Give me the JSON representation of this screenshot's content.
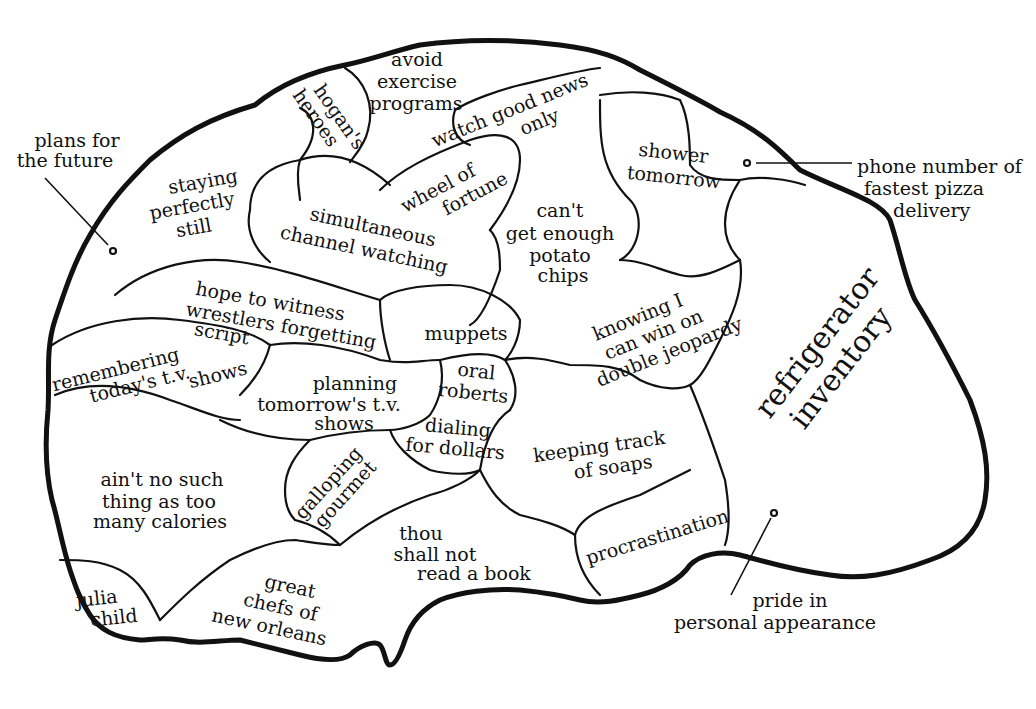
{
  "diagram": {
    "type": "brain-map",
    "outline_color": "#111111",
    "background": "#ffffff",
    "regions": [
      {
        "id": "hogans-heroes",
        "lines": [
          "hogan's",
          "heroes"
        ]
      },
      {
        "id": "avoid-exercise",
        "lines": [
          "avoid",
          "exercise",
          "programs"
        ]
      },
      {
        "id": "watch-good-news",
        "lines": [
          "watch good news",
          "only"
        ]
      },
      {
        "id": "shower-tomorrow",
        "lines": [
          "shower",
          "tomorrow"
        ]
      },
      {
        "id": "staying-still",
        "lines": [
          "staying",
          "perfectly",
          "still"
        ]
      },
      {
        "id": "wheel-of-fortune",
        "lines": [
          "wheel of",
          "fortune"
        ]
      },
      {
        "id": "simultaneous-channel",
        "lines": [
          "simultaneous",
          "channel watching"
        ]
      },
      {
        "id": "potato-chips",
        "lines": [
          "can't",
          "get enough",
          "potato",
          "chips"
        ]
      },
      {
        "id": "wrestlers",
        "lines": [
          "hope to witness",
          "wrestlers forgetting",
          "script"
        ]
      },
      {
        "id": "muppets",
        "lines": [
          "muppets"
        ]
      },
      {
        "id": "double-jeopardy",
        "lines": [
          "knowing I",
          "can win on",
          "double jeopardy"
        ]
      },
      {
        "id": "refrigerator",
        "lines": [
          "refrigerator",
          "inventory"
        ]
      },
      {
        "id": "remembering-tv",
        "lines": [
          "remembering",
          "today's t.v.",
          "shows"
        ]
      },
      {
        "id": "planning-tv",
        "lines": [
          "planning",
          "tomorrow's t.v.",
          "shows"
        ]
      },
      {
        "id": "oral-roberts",
        "lines": [
          "oral",
          "roberts"
        ]
      },
      {
        "id": "dialing-dollars",
        "lines": [
          "dialing",
          "for dollars"
        ]
      },
      {
        "id": "keeping-soaps",
        "lines": [
          "keeping track",
          "of soaps"
        ]
      },
      {
        "id": "calories",
        "lines": [
          "ain't no such",
          "thing as too",
          "many calories"
        ]
      },
      {
        "id": "galloping-gourmet",
        "lines": [
          "galloping",
          "gourmet"
        ]
      },
      {
        "id": "thou-shall-not",
        "lines": [
          "thou",
          "shall not",
          "read a book"
        ]
      },
      {
        "id": "procrastination",
        "lines": [
          "procrastination"
        ]
      },
      {
        "id": "julia-child",
        "lines": [
          "julia",
          "child"
        ]
      },
      {
        "id": "great-chefs",
        "lines": [
          "great",
          "chefs of",
          "new orleans"
        ]
      }
    ],
    "callouts": [
      {
        "id": "plans-future",
        "lines": [
          "plans for",
          "the future"
        ]
      },
      {
        "id": "pizza-phone",
        "lines": [
          "phone number of",
          "fastest pizza",
          "delivery"
        ]
      },
      {
        "id": "pride-appearance",
        "lines": [
          "pride in",
          "personal appearance"
        ]
      }
    ]
  }
}
